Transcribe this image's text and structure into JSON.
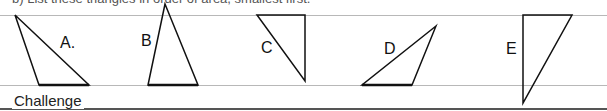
{
  "question": {
    "text": "b) List these triangles in order of area, smallest first."
  },
  "triangles": [
    {
      "label": "A.",
      "points": "15,15 39,85 89,85",
      "label_x": 60,
      "label_y": 34
    },
    {
      "label": "B",
      "points": "165,4 148,85 198,85",
      "label_x": 141,
      "label_y": 32
    },
    {
      "label": "C",
      "points": "257,15 305,15 305,81",
      "label_x": 261,
      "label_y": 39
    },
    {
      "label": "D",
      "points": "436,26 362,85 412,85",
      "label_x": 384,
      "label_y": 40
    },
    {
      "label": "E",
      "points": "523,15 572,15 523,103",
      "label_x": 506,
      "label_y": 40
    }
  ],
  "footer": {
    "section_title": "Challenge"
  }
}
